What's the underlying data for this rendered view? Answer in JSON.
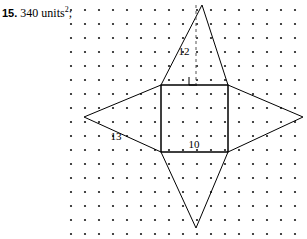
{
  "answer": {
    "item_number": "15.",
    "value": "340 units",
    "exponent": "2",
    "separator": ";"
  },
  "figure": {
    "labels": {
      "slant_height": "12",
      "base": "10",
      "diagonal_side": "13"
    },
    "grid": {
      "dot_color": "#1a1a1a",
      "columns": 17,
      "rows": 17,
      "spacing": 14,
      "origin_x": 11,
      "origin_y": 10,
      "dot_radius": 1.1
    },
    "stroke_color": "#000000",
    "dashed_color": "#555555",
    "shapes": {
      "square": {
        "x": 101,
        "y": 85,
        "width": 67,
        "height": 67
      },
      "top_triangle": "142,5 101,85 168,85",
      "left_triangle": "24,117 101,85 101,152",
      "right_triangle": "243,117 168,85 168,152",
      "bottom_triangle": "136,228 101,152 168,152",
      "altitude_line": "136,5 136,85",
      "right_angle_marker": "129,77 129,85 137,85"
    }
  }
}
